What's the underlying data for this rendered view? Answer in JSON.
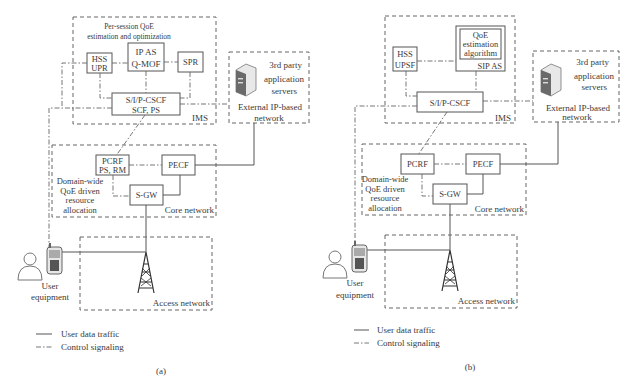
{
  "panel_a": {
    "caption": "(a)",
    "ims_label": "IMS",
    "ims_subtitle_1": "Per-session QoE",
    "ims_subtitle_2": "estimation and optimization",
    "hss_1": "HSS",
    "hss_2": "UPR",
    "ipas_1": "IP AS",
    "ipas_2": "Q-MOF",
    "spr": "SPR",
    "cscf_1": "S/I/P-CSCF",
    "cscf_2": "SCF, PS",
    "ext_1": "3rd party",
    "ext_2": "application",
    "ext_3": "servers",
    "ext_4": "External IP-based",
    "ext_5": "network",
    "pcrf_1": "PCRF",
    "pcrf_2": "PS, RM",
    "pecf": "PECF",
    "sgw": "S-GW",
    "domain_1": "Domain-wide",
    "domain_2": "QoE driven",
    "domain_3": "resource",
    "domain_4": "allocation",
    "core_label": "Core network",
    "access_label": "Access network",
    "ue_1": "User",
    "ue_2": "equipment",
    "legend_data": "User data traffic",
    "legend_ctrl": "Control signaling"
  },
  "panel_b": {
    "caption": "(b)",
    "ims_label": "IMS",
    "hss_1": "HSS",
    "hss_2": "UPSF",
    "qoe_1": "QoE",
    "qoe_2": "estimation",
    "qoe_3": "algorithm",
    "sipas": "SIP AS",
    "cscf": "S/I/P-CSCF",
    "ext_1": "3rd party",
    "ext_2": "application",
    "ext_3": "servers",
    "ext_4": "External IP-based",
    "ext_5": "network",
    "pcrf": "PCRF",
    "pecf": "PECF",
    "sgw": "S-GW",
    "domain_1": "Domain-wide",
    "domain_2": "QoE driven",
    "domain_3": "resource",
    "domain_4": "allocation",
    "core_label": "Core network",
    "access_label": "Access network",
    "ue_1": "User",
    "ue_2": "equipment",
    "legend_data": "User data traffic",
    "legend_ctrl": "Control signaling"
  }
}
